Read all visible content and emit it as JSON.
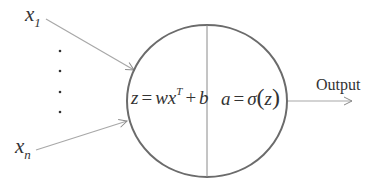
{
  "diagram": {
    "type": "neuron",
    "inputs": {
      "first": {
        "symbol": "x",
        "subscript": "1"
      },
      "last": {
        "symbol": "x",
        "subscript": "n"
      },
      "ellipsis_dots": 5
    },
    "neuron": {
      "left_equation": {
        "lhs": "z",
        "eq": "=",
        "w": "w",
        "x": "x",
        "sup": "T",
        "plus": "+",
        "b": "b"
      },
      "right_equation": {
        "lhs": "a",
        "eq": "=",
        "sigma": "σ",
        "open": "(",
        "arg": "z",
        "close": ")"
      }
    },
    "output_label": "Output",
    "colors": {
      "circle": "#6b6b6b",
      "arrows": "#9a9a9a",
      "divider": "#8a8a8a",
      "text": "#333333"
    }
  }
}
